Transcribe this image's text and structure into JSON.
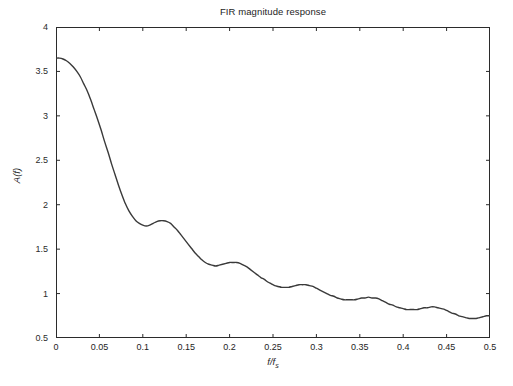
{
  "figure": {
    "background_color": "#ffffff",
    "axis_color": "#2b2b2b",
    "line_color": "#3a3a3a",
    "text_color": "#1d1d1d"
  },
  "chart_data": {
    "type": "line",
    "title": "FIR magnitude response",
    "xlabel": "f/f",
    "xlabel_subscript": "s",
    "ylabel": "A(f)",
    "xlim": [
      0,
      0.5
    ],
    "ylim": [
      0.5,
      4
    ],
    "grid": false,
    "legend": null,
    "xticks": [
      0,
      0.05,
      0.1,
      0.15,
      0.2,
      0.25,
      0.3,
      0.35,
      0.4,
      0.45,
      0.5
    ],
    "xtick_labels": [
      "0",
      "0.05",
      "0.1",
      "0.15",
      "0.2",
      "0.25",
      "0.3",
      "0.35",
      "0.4",
      "0.45",
      "0.5"
    ],
    "yticks": [
      0.5,
      1,
      1.5,
      2,
      2.5,
      3,
      3.5,
      4
    ],
    "ytick_labels": [
      "0.5",
      "1",
      "1.5",
      "2",
      "2.5",
      "3",
      "3.5",
      "4"
    ],
    "series": [
      {
        "name": "A(f)",
        "x": [
          0.0,
          0.004,
          0.008,
          0.012,
          0.016,
          0.02,
          0.024,
          0.028,
          0.032,
          0.036,
          0.04,
          0.044,
          0.048,
          0.052,
          0.056,
          0.06,
          0.064,
          0.068,
          0.072,
          0.076,
          0.08,
          0.084,
          0.088,
          0.092,
          0.096,
          0.1,
          0.104,
          0.108,
          0.112,
          0.116,
          0.12,
          0.124,
          0.128,
          0.132,
          0.136,
          0.14,
          0.144,
          0.148,
          0.152,
          0.156,
          0.16,
          0.164,
          0.168,
          0.172,
          0.176,
          0.18,
          0.184,
          0.188,
          0.192,
          0.196,
          0.2,
          0.204,
          0.208,
          0.212,
          0.216,
          0.22,
          0.224,
          0.228,
          0.232,
          0.236,
          0.24,
          0.244,
          0.248,
          0.252,
          0.256,
          0.26,
          0.264,
          0.268,
          0.272,
          0.276,
          0.28,
          0.284,
          0.288,
          0.292,
          0.296,
          0.3,
          0.304,
          0.308,
          0.312,
          0.316,
          0.32,
          0.324,
          0.328,
          0.332,
          0.336,
          0.34,
          0.344,
          0.348,
          0.352,
          0.356,
          0.36,
          0.364,
          0.368,
          0.372,
          0.376,
          0.38,
          0.384,
          0.388,
          0.392,
          0.396,
          0.4,
          0.404,
          0.408,
          0.412,
          0.416,
          0.42,
          0.424,
          0.428,
          0.432,
          0.436,
          0.44,
          0.444,
          0.448,
          0.452,
          0.456,
          0.46,
          0.464,
          0.468,
          0.472,
          0.476,
          0.48,
          0.484,
          0.488,
          0.492,
          0.496,
          0.5
        ],
        "y": [
          3.65,
          3.65,
          3.64,
          3.62,
          3.59,
          3.55,
          3.5,
          3.44,
          3.36,
          3.28,
          3.18,
          3.07,
          2.96,
          2.84,
          2.71,
          2.59,
          2.46,
          2.34,
          2.22,
          2.11,
          2.01,
          1.93,
          1.87,
          1.82,
          1.79,
          1.77,
          1.76,
          1.77,
          1.79,
          1.81,
          1.82,
          1.82,
          1.81,
          1.79,
          1.75,
          1.71,
          1.66,
          1.61,
          1.56,
          1.51,
          1.46,
          1.42,
          1.38,
          1.35,
          1.33,
          1.32,
          1.31,
          1.32,
          1.33,
          1.34,
          1.35,
          1.35,
          1.35,
          1.34,
          1.32,
          1.3,
          1.27,
          1.24,
          1.21,
          1.18,
          1.16,
          1.13,
          1.11,
          1.09,
          1.08,
          1.07,
          1.07,
          1.07,
          1.08,
          1.09,
          1.1,
          1.1,
          1.1,
          1.09,
          1.08,
          1.06,
          1.04,
          1.02,
          1.0,
          0.98,
          0.97,
          0.95,
          0.94,
          0.93,
          0.93,
          0.93,
          0.93,
          0.94,
          0.95,
          0.95,
          0.96,
          0.95,
          0.95,
          0.94,
          0.92,
          0.9,
          0.88,
          0.87,
          0.85,
          0.84,
          0.83,
          0.82,
          0.82,
          0.82,
          0.82,
          0.83,
          0.84,
          0.84,
          0.85,
          0.85,
          0.84,
          0.83,
          0.82,
          0.8,
          0.78,
          0.77,
          0.75,
          0.74,
          0.73,
          0.72,
          0.72,
          0.72,
          0.73,
          0.74,
          0.75,
          0.75
        ]
      }
    ]
  }
}
